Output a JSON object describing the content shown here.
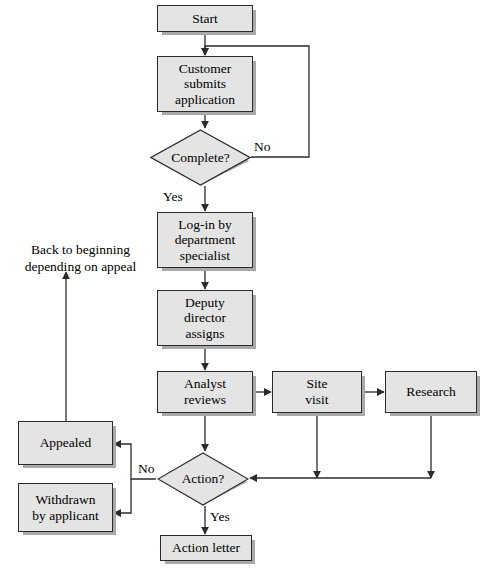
{
  "diagram": {
    "colors": {
      "node_fill": "#e4e4e4",
      "node_border": "#2b2b2b",
      "node_shadow": "#a9a9a9",
      "edge": "#2b2b2b",
      "background": "#ffffff"
    },
    "nodes": [
      {
        "id": "start",
        "shape": "box",
        "label": "Start",
        "x": 157,
        "y": 5,
        "w": 96,
        "h": 27
      },
      {
        "id": "customer",
        "shape": "box",
        "label": "Customer\nsubmits\napplication",
        "x": 157,
        "y": 56,
        "w": 96,
        "h": 56
      },
      {
        "id": "complete",
        "shape": "diamond",
        "label": "Complete?",
        "x": 150,
        "y": 129,
        "w": 101,
        "h": 57
      },
      {
        "id": "login",
        "shape": "box",
        "label": "Log-in by\ndepartment\nspecialist",
        "x": 157,
        "y": 212,
        "w": 96,
        "h": 56
      },
      {
        "id": "deputy",
        "shape": "box",
        "label": "Deputy\ndirector\nassigns",
        "x": 157,
        "y": 290,
        "w": 96,
        "h": 56
      },
      {
        "id": "analyst",
        "shape": "box",
        "label": "Analyst\nreviews",
        "x": 157,
        "y": 371,
        "w": 96,
        "h": 42
      },
      {
        "id": "sitevisit",
        "shape": "box",
        "label": "Site\nvisit",
        "x": 272,
        "y": 371,
        "w": 90,
        "h": 42
      },
      {
        "id": "research",
        "shape": "box",
        "label": "Research",
        "x": 385,
        "y": 371,
        "w": 92,
        "h": 42
      },
      {
        "id": "action",
        "shape": "diamond",
        "label": "Action?",
        "x": 157,
        "y": 452,
        "w": 92,
        "h": 54
      },
      {
        "id": "appealed",
        "shape": "box",
        "label": "Appealed",
        "x": 18,
        "y": 421,
        "w": 95,
        "h": 44
      },
      {
        "id": "withdrawn",
        "shape": "box",
        "label": "Withdrawn\nby applicant",
        "x": 18,
        "y": 483,
        "w": 95,
        "h": 49
      },
      {
        "id": "letter",
        "shape": "box",
        "label": "Action letter",
        "x": 160,
        "y": 535,
        "w": 92,
        "h": 26
      }
    ],
    "edge_labels": [
      {
        "id": "complete-no",
        "text": "No",
        "x": 254,
        "y": 139
      },
      {
        "id": "complete-yes",
        "text": "Yes",
        "x": 163,
        "y": 189
      },
      {
        "id": "action-no",
        "text": "No",
        "x": 138,
        "y": 461
      },
      {
        "id": "action-yes",
        "text": "Yes",
        "x": 210,
        "y": 509
      }
    ],
    "notes": [
      {
        "id": "appeal-note",
        "text": "Back to beginning\ndepending on appeal",
        "x": 8,
        "y": 242,
        "w": 145
      }
    ],
    "edges": [
      {
        "from": "start",
        "to": "customer",
        "label": ""
      },
      {
        "from": "customer",
        "to": "complete",
        "label": ""
      },
      {
        "from": "complete",
        "to": "customer",
        "label": "No"
      },
      {
        "from": "complete",
        "to": "login",
        "label": "Yes"
      },
      {
        "from": "login",
        "to": "deputy",
        "label": ""
      },
      {
        "from": "deputy",
        "to": "analyst",
        "label": ""
      },
      {
        "from": "analyst",
        "to": "sitevisit",
        "label": ""
      },
      {
        "from": "sitevisit",
        "to": "research",
        "label": ""
      },
      {
        "from": "analyst",
        "to": "action",
        "label": ""
      },
      {
        "from": "sitevisit",
        "to": "action",
        "label": ""
      },
      {
        "from": "research",
        "to": "action",
        "label": ""
      },
      {
        "from": "action",
        "to": "appealed",
        "label": "No"
      },
      {
        "from": "action",
        "to": "withdrawn",
        "label": "No"
      },
      {
        "from": "action",
        "to": "letter",
        "label": "Yes"
      },
      {
        "from": "appealed",
        "to": "appeal-note",
        "label": ""
      }
    ]
  }
}
